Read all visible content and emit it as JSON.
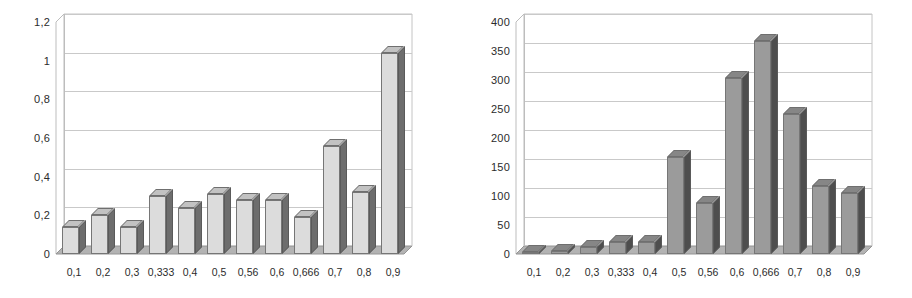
{
  "figure": {
    "background": "#ffffff",
    "panel_count": 2
  },
  "chart_data": [
    {
      "type": "bar",
      "title": "",
      "subtitle": "",
      "xlabel": "",
      "ylabel": "",
      "categories": [
        "0,1",
        "0,2",
        "0,3",
        "0,333",
        "0,4",
        "0,5",
        "0,56",
        "0,6",
        "0,666",
        "0,7",
        "0,8",
        "0,9"
      ],
      "values": [
        0.14,
        0.2,
        0.14,
        0.3,
        0.24,
        0.31,
        0.28,
        0.28,
        0.19,
        0.56,
        0.32,
        1.04
      ],
      "ylim": [
        0,
        1.2
      ],
      "ytick_labels": [
        "0",
        "0,2",
        "0,4",
        "0,6",
        "0,8",
        "1",
        "1,2"
      ],
      "ytick_values": [
        0,
        0.2,
        0.4,
        0.6,
        0.8,
        1,
        1.2
      ],
      "grid": true,
      "legend": false,
      "legend_position": "none",
      "style": "3d-column",
      "bar_face_color": "#dcdcdc",
      "bar_side_color": "#6d6d6d",
      "bar_top_color": "#c2c2c2",
      "gridline_color": "#c9c9c9"
    },
    {
      "type": "bar",
      "title": "",
      "subtitle": "",
      "xlabel": "",
      "ylabel": "",
      "categories": [
        "0,1",
        "0,2",
        "0,3",
        "0,333",
        "0,4",
        "0,5",
        "0,56",
        "0,6",
        "0,666",
        "0,7",
        "0,8",
        "0,9"
      ],
      "values": [
        3,
        6,
        12,
        20,
        20,
        167,
        88,
        303,
        368,
        241,
        118,
        106
      ],
      "ylim": [
        0,
        400
      ],
      "ytick_labels": [
        "0",
        "50",
        "100",
        "150",
        "200",
        "250",
        "300",
        "350",
        "400"
      ],
      "ytick_values": [
        0,
        50,
        100,
        150,
        200,
        250,
        300,
        350,
        400
      ],
      "grid": true,
      "legend": false,
      "legend_position": "none",
      "style": "3d-column",
      "bar_face_color": "#9b9b9b",
      "bar_side_color": "#4e4e4e",
      "bar_top_color": "#868686",
      "gridline_color": "#c9c9c9"
    }
  ]
}
